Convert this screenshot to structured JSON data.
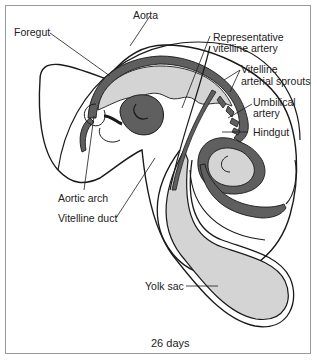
{
  "figure": {
    "caption": "26 days",
    "colors": {
      "outline": "#1a1a1a",
      "dark_vessel": "#5f5f5f",
      "light_gut": "#d4d4d4",
      "frame": "#9a9a9a"
    },
    "labels": {
      "aorta": "Aorta",
      "foregut": "Foregut",
      "representative_vitelline_artery_1": "Representative",
      "representative_vitelline_artery_2": "vitelline artery",
      "vitelline_arterial_sprouts_1": "Vitelline",
      "vitelline_arterial_sprouts_2": "arterial sprouts",
      "umbilical_artery_1": "Umbilical",
      "umbilical_artery_2": "artery",
      "hindgut": "Hindgut",
      "aortic_arch": "Aortic arch",
      "vitelline_duct": "Vitelline duct",
      "yolk_sac": "Yolk sac"
    }
  }
}
